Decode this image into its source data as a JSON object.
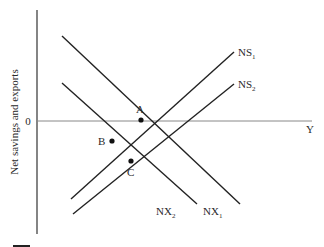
{
  "diagram": {
    "y_axis_label": "Net savings and exports",
    "x_axis_label": "Y",
    "origin_label": "0",
    "curves": [
      {
        "id": "NS1",
        "base": "NS",
        "sub": "1",
        "x1": 71,
        "y1": 199,
        "x2": 234,
        "y2": 52,
        "label_x": 238,
        "label_y": 56
      },
      {
        "id": "NS2",
        "base": "NS",
        "sub": "2",
        "x1": 73,
        "y1": 214,
        "x2": 234,
        "y2": 84,
        "label_x": 238,
        "label_y": 88
      },
      {
        "id": "NX1",
        "base": "NX",
        "sub": "1",
        "x1": 62,
        "y1": 36,
        "x2": 240,
        "y2": 204,
        "label_x": 203,
        "label_y": 215
      },
      {
        "id": "NX2",
        "base": "NX",
        "sub": "2",
        "x1": 62,
        "y1": 83,
        "x2": 197,
        "y2": 204,
        "label_x": 156,
        "label_y": 215
      }
    ],
    "points": [
      {
        "id": "A",
        "x": 141,
        "y": 120,
        "label_x": 136,
        "label_y": 113
      },
      {
        "id": "B",
        "x": 112,
        "y": 141,
        "label_x": 98,
        "label_y": 145
      },
      {
        "id": "C",
        "x": 131,
        "y": 161,
        "label_x": 127,
        "label_y": 176
      }
    ]
  }
}
